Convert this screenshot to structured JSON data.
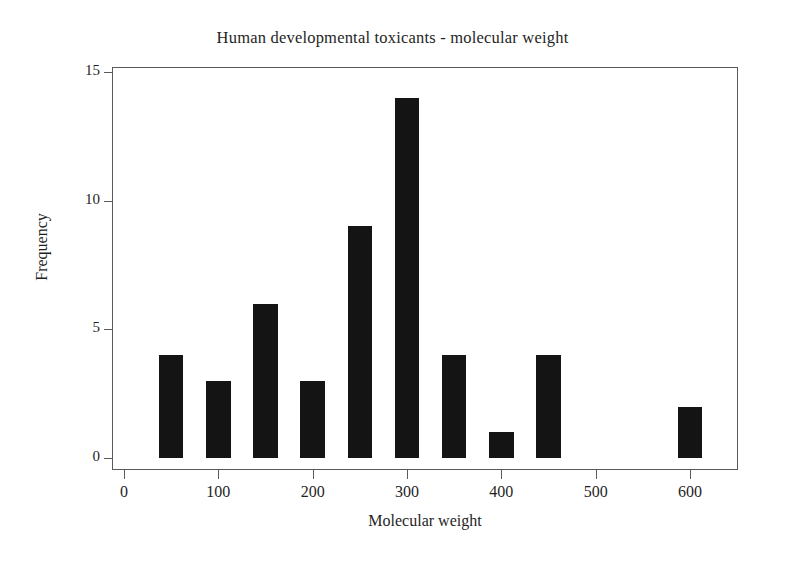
{
  "chart_data": {
    "type": "bar",
    "title": "Human developmental toxicants - molecular weight",
    "xlabel": "Molecular weight",
    "ylabel": "Frequency",
    "categories": [
      50,
      100,
      150,
      200,
      250,
      300,
      350,
      400,
      450,
      600
    ],
    "values": [
      4,
      3,
      6,
      3,
      9,
      14,
      4,
      1,
      4,
      2
    ],
    "bin_width": 26,
    "xlim": [
      -20,
      650
    ],
    "ylim": [
      0,
      15
    ],
    "xticks": [
      0,
      100,
      200,
      300,
      400,
      500,
      600
    ],
    "xticklabels": [
      "0",
      "100",
      "200",
      "300",
      "400",
      "500",
      "600"
    ],
    "yticks": [
      0,
      5,
      10,
      15
    ],
    "yticklabels": [
      "0",
      "5",
      "10",
      "15"
    ],
    "grid": false,
    "legend": false,
    "bar_color": "#141414",
    "axis_color": "#5a5a5a",
    "background": "#ffffff"
  }
}
